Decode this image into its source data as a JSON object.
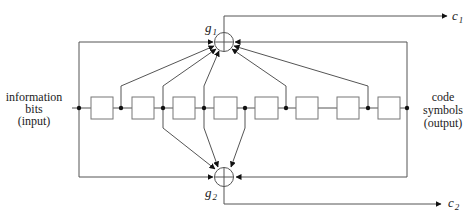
{
  "diagram": {
    "type": "convolutional-encoder",
    "input_label": [
      "information",
      "bits",
      "(input)"
    ],
    "output_label": [
      "code",
      "symbols",
      "(output)"
    ],
    "adders": [
      {
        "name": "g",
        "subscript": "1",
        "output": "c",
        "output_subscript": "1"
      },
      {
        "name": "g",
        "subscript": "2",
        "output": "c",
        "output_subscript": "2"
      }
    ],
    "register_count": 8,
    "taps_to_g1": [
      0,
      1,
      2,
      3,
      5,
      7,
      8
    ],
    "taps_to_g2": [
      0,
      2,
      3,
      4,
      8
    ],
    "colors": {
      "line": "#555555",
      "box": "#777777",
      "dot": "#111111",
      "text": "#222222"
    }
  }
}
